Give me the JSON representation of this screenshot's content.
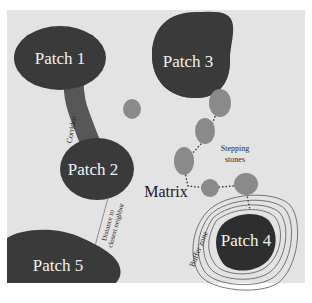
{
  "colors": {
    "background": "#ffffff",
    "matrix": "#e3e3e3",
    "patch": "#3a3a3a",
    "corridor": "#555555",
    "stepping_stone": "#8a8a8a",
    "buffer_line": "#555555",
    "label_light": "#f2f2f2",
    "label_dark": "#1a1a1a"
  },
  "patches": [
    {
      "id": "patch-1",
      "label": "Patch 1"
    },
    {
      "id": "patch-2",
      "label": "Patch 2"
    },
    {
      "id": "patch-3",
      "label": "Patch 3"
    },
    {
      "id": "patch-4",
      "label": "Patch 4"
    },
    {
      "id": "patch-5",
      "label": "Patch 5"
    }
  ],
  "labels": {
    "matrix": "Matrix",
    "corridor": "Corridor",
    "stepping_stones_line1": "Stepping",
    "stepping_stones_line2": "stones",
    "distance_line1": "Distance to",
    "distance_line2": "closest neighbor",
    "buffer_zone": "Buffer zone"
  },
  "stepping_stone_count": 6
}
